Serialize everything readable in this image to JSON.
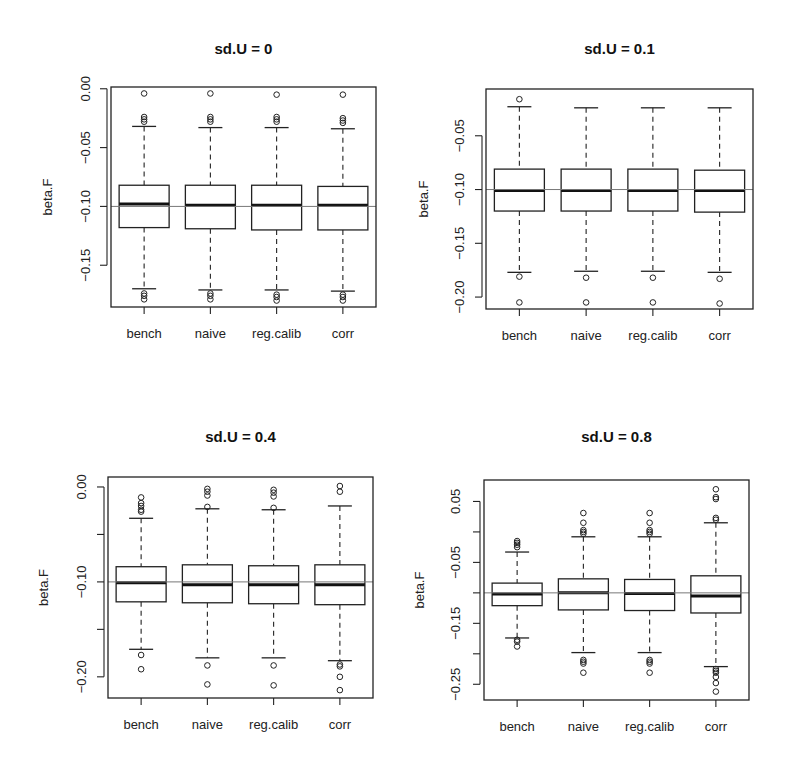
{
  "chart_data": [
    {
      "type": "boxplot",
      "title": "sd.U =  0",
      "xlabel": "",
      "ylabel": "beta.F",
      "categories": [
        "bench",
        "naive",
        "reg.calib",
        "corr"
      ],
      "yticks": [
        0.0,
        -0.05,
        -0.1,
        -0.15
      ],
      "ytick_labels": [
        "0.00",
        "-0.05",
        "-0.10",
        "-0.15"
      ],
      "ylim": [
        -0.1855,
        0.0015
      ],
      "reference_line": -0.1,
      "boxes": [
        {
          "name": "bench",
          "upper_whisker": -0.032,
          "q3": -0.082,
          "median": -0.098,
          "q1": -0.118,
          "lower_whisker": -0.17,
          "outliers": [
            -0.004,
            -0.024,
            -0.026,
            -0.028,
            -0.174,
            -0.176,
            -0.179
          ]
        },
        {
          "name": "naive",
          "upper_whisker": -0.033,
          "q3": -0.082,
          "median": -0.099,
          "q1": -0.119,
          "lower_whisker": -0.171,
          "outliers": [
            -0.004,
            -0.024,
            -0.026,
            -0.028,
            -0.174,
            -0.176,
            -0.179
          ]
        },
        {
          "name": "reg.calib",
          "upper_whisker": -0.033,
          "q3": -0.082,
          "median": -0.099,
          "q1": -0.12,
          "lower_whisker": -0.171,
          "outliers": [
            -0.005,
            -0.024,
            -0.026,
            -0.028,
            -0.175,
            -0.177,
            -0.18
          ]
        },
        {
          "name": "corr",
          "upper_whisker": -0.034,
          "q3": -0.083,
          "median": -0.099,
          "q1": -0.12,
          "lower_whisker": -0.172,
          "outliers": [
            -0.005,
            -0.025,
            -0.027,
            -0.029,
            -0.175,
            -0.177,
            -0.18
          ]
        }
      ]
    },
    {
      "type": "boxplot",
      "title": "sd.U =  0.1",
      "xlabel": "",
      "ylabel": "beta.F",
      "categories": [
        "bench",
        "naive",
        "reg.calib",
        "corr"
      ],
      "yticks": [
        -0.05,
        -0.1,
        -0.15,
        -0.2
      ],
      "ytick_labels": [
        "-0.05",
        "-0.10",
        "-0.15",
        "-0.20"
      ],
      "ylim": [
        -0.2111,
        -0.0065
      ],
      "reference_line": -0.1,
      "boxes": [
        {
          "name": "bench",
          "upper_whisker": -0.023,
          "q3": -0.081,
          "median": -0.101,
          "q1": -0.12,
          "lower_whisker": -0.177,
          "outliers": [
            -0.016,
            -0.181,
            -0.205
          ]
        },
        {
          "name": "naive",
          "upper_whisker": -0.024,
          "q3": -0.081,
          "median": -0.101,
          "q1": -0.12,
          "lower_whisker": -0.176,
          "outliers": [
            -0.182,
            -0.205
          ]
        },
        {
          "name": "reg.calib",
          "upper_whisker": -0.024,
          "q3": -0.081,
          "median": -0.101,
          "q1": -0.12,
          "lower_whisker": -0.176,
          "outliers": [
            -0.182,
            -0.205
          ]
        },
        {
          "name": "corr",
          "upper_whisker": -0.024,
          "q3": -0.082,
          "median": -0.101,
          "q1": -0.121,
          "lower_whisker": -0.177,
          "outliers": [
            -0.183,
            -0.206
          ]
        }
      ]
    },
    {
      "type": "boxplot",
      "title": "sd.U =  0.4",
      "xlabel": "",
      "ylabel": "beta.F",
      "categories": [
        "bench",
        "naive",
        "reg.calib",
        "corr"
      ],
      "yticks": [
        0.0,
        -0.05,
        -0.1,
        -0.15,
        -0.2
      ],
      "ytick_labels": [
        "0.00",
        "",
        "-0.10",
        "",
        "-0.20"
      ],
      "ylim": [
        -0.2223,
        0.0105
      ],
      "reference_line": -0.1,
      "boxes": [
        {
          "name": "bench",
          "upper_whisker": -0.033,
          "q3": -0.084,
          "median": -0.101,
          "q1": -0.121,
          "lower_whisker": -0.171,
          "outliers": [
            -0.011,
            -0.017,
            -0.02,
            -0.024,
            -0.026,
            -0.177,
            -0.192
          ]
        },
        {
          "name": "naive",
          "upper_whisker": -0.023,
          "q3": -0.082,
          "median": -0.103,
          "q1": -0.122,
          "lower_whisker": -0.18,
          "outliers": [
            -0.002,
            -0.005,
            -0.009,
            -0.021,
            -0.188,
            -0.208
          ]
        },
        {
          "name": "reg.calib",
          "upper_whisker": -0.024,
          "q3": -0.083,
          "median": -0.103,
          "q1": -0.123,
          "lower_whisker": -0.18,
          "outliers": [
            -0.003,
            -0.006,
            -0.01,
            -0.022,
            -0.188,
            -0.209
          ]
        },
        {
          "name": "corr",
          "upper_whisker": -0.02,
          "q3": -0.082,
          "median": -0.103,
          "q1": -0.124,
          "lower_whisker": -0.183,
          "outliers": [
            0.001,
            -0.005,
            -0.187,
            -0.189,
            -0.2,
            -0.214
          ]
        }
      ]
    },
    {
      "type": "boxplot",
      "title": "sd.U =  0.8",
      "xlabel": "",
      "ylabel": "beta.F",
      "categories": [
        "bench",
        "naive",
        "reg.calib",
        "corr"
      ],
      "yticks": [
        0.05,
        0.0,
        -0.05,
        -0.1,
        -0.15,
        -0.2,
        -0.25
      ],
      "ytick_labels": [
        "0.05",
        "",
        "-0.05",
        "",
        "-0.15",
        "",
        "-0.25"
      ],
      "ylim": [
        -0.2758,
        0.0852
      ],
      "reference_line": -0.1,
      "boxes": [
        {
          "name": "bench",
          "upper_whisker": -0.033,
          "q3": -0.084,
          "median": -0.102,
          "q1": -0.121,
          "lower_whisker": -0.174,
          "outliers": [
            -0.015,
            -0.018,
            -0.021,
            -0.025,
            -0.177,
            -0.18,
            -0.188
          ]
        },
        {
          "name": "naive",
          "upper_whisker": -0.008,
          "q3": -0.077,
          "median": -0.1,
          "q1": -0.128,
          "lower_whisker": -0.198,
          "outliers": [
            0.031,
            0.015,
            0.003,
            0.0,
            -0.003,
            -0.21,
            -0.213,
            -0.216,
            -0.231
          ]
        },
        {
          "name": "reg.calib",
          "upper_whisker": -0.008,
          "q3": -0.078,
          "median": -0.101,
          "q1": -0.129,
          "lower_whisker": -0.198,
          "outliers": [
            0.031,
            0.015,
            0.003,
            0.0,
            -0.003,
            -0.21,
            -0.213,
            -0.216,
            -0.231
          ]
        },
        {
          "name": "corr",
          "upper_whisker": 0.015,
          "q3": -0.072,
          "median": -0.105,
          "q1": -0.133,
          "lower_whisker": -0.221,
          "outliers": [
            0.07,
            0.057,
            0.054,
            0.023,
            0.02,
            -0.225,
            -0.228,
            -0.231,
            -0.238,
            -0.248,
            -0.262
          ]
        }
      ]
    }
  ]
}
